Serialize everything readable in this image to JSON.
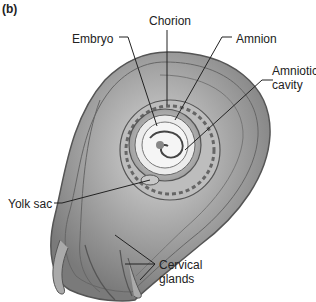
{
  "panel_label": "(b)",
  "labels": {
    "chorion": "Chorion",
    "embryo": "Embryo",
    "amnion": "Amnion",
    "amniotic_cavity_1": "Amniotic",
    "amniotic_cavity_2": "cavity",
    "yolk_sac": "Yolk sac",
    "cervical_glands_1": "Cervical",
    "cervical_glands_2": "glands"
  }
}
